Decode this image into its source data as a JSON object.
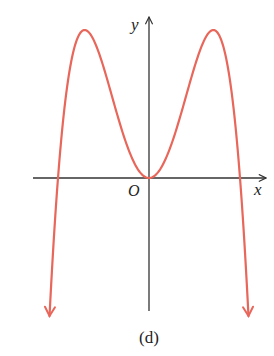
{
  "chart_data": {
    "type": "line",
    "title": "",
    "caption": "(d)",
    "xlabel": "x",
    "ylabel": "y",
    "origin_label": "O",
    "grid": false,
    "legend": null,
    "function_form": "y = k * x^2 * (r^2 - x^2)",
    "series": [
      {
        "name": "curve",
        "color": "#e8665a",
        "key_points": [
          {
            "label": "left end (arrow down)",
            "x": -1.1,
            "y": "-inf"
          },
          {
            "label": "left root",
            "x": -1.0,
            "y": 0
          },
          {
            "label": "left maximum",
            "x": -0.707,
            "y": 1.0
          },
          {
            "label": "origin (double root, local min)",
            "x": 0,
            "y": 0
          },
          {
            "label": "right maximum",
            "x": 0.707,
            "y": 1.0
          },
          {
            "label": "right root",
            "x": 1.0,
            "y": 0
          },
          {
            "label": "right end (arrow down)",
            "x": 1.1,
            "y": "-inf"
          }
        ]
      }
    ],
    "pixel_geometry": {
      "origin": [
        149,
        178
      ],
      "root_offset_px": 91,
      "peak_height_px": 148,
      "x_axis": {
        "x1": 33,
        "x2": 266
      },
      "y_axis": {
        "y1": 17,
        "y2": 311
      },
      "curve_end_y": 316
    },
    "axis_color": "#333333"
  }
}
